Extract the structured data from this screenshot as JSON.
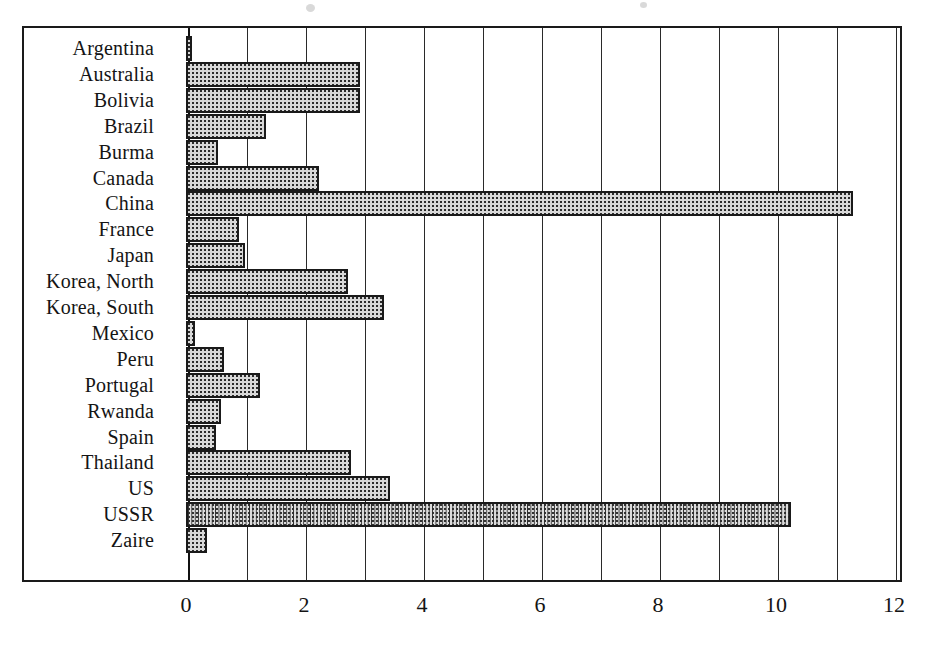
{
  "chart_data": {
    "type": "bar",
    "orientation": "horizontal",
    "title": "",
    "subtitle": "",
    "xlabel": "",
    "ylabel": "",
    "xlim": [
      0,
      12
    ],
    "xticks": [
      0,
      2,
      4,
      6,
      8,
      10,
      12
    ],
    "xtick_labels": [
      "0",
      "2",
      "4",
      "6",
      "8",
      "10",
      "12"
    ],
    "grid": true,
    "grid_axis": "x",
    "grid_step": 1,
    "legend": null,
    "categories": [
      "Argentina",
      "Australia",
      "Bolivia",
      "Brazil",
      "Burma",
      "Canada",
      "China",
      "France",
      "Japan",
      "Korea, North",
      "Korea, South",
      "Mexico",
      "Peru",
      "Portugal",
      "Rwanda",
      "Spain",
      "Thailand",
      "US",
      "USSR",
      "Zaire"
    ],
    "values": [
      0.1,
      2.95,
      2.95,
      1.35,
      0.55,
      2.25,
      11.3,
      0.9,
      1.0,
      2.75,
      3.35,
      0.15,
      0.65,
      1.25,
      0.6,
      0.5,
      2.8,
      3.45,
      10.25,
      0.35
    ],
    "bar_fill": "#d8d8d8",
    "bar_edge": "#1a1a1a",
    "background": "#ffffff"
  }
}
